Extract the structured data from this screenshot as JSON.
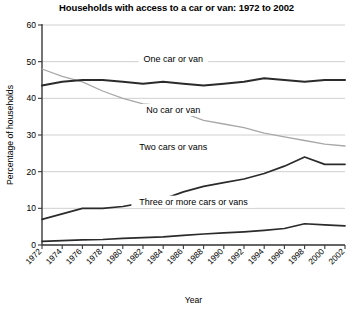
{
  "chart_data": {
    "type": "line",
    "title": "Households with access to a car or van: 1972 to 2002",
    "xlabel": "Year",
    "ylabel": "Percentage of households",
    "grid": true,
    "legend_position": "inline-labels",
    "xlim": [
      1972,
      2002
    ],
    "ylim": [
      0,
      60
    ],
    "yticks": [
      0,
      10,
      20,
      30,
      40,
      50,
      60
    ],
    "categories": [
      1972,
      1974,
      1976,
      1978,
      1980,
      1982,
      1984,
      1986,
      1988,
      1990,
      1992,
      1994,
      1996,
      1998,
      2000,
      2002
    ],
    "xtick_labels": [
      "1972",
      "1974",
      "1976",
      "1978",
      "1980",
      "1982",
      "1984",
      "1986",
      "1988",
      "1990",
      "1992",
      "1994",
      "1996",
      "1998",
      "2000",
      "2002"
    ],
    "series": [
      {
        "name": "No car or van",
        "color": "#a8a8a8",
        "width": 1.3,
        "label_x": 1985,
        "label_y": 36,
        "values": [
          48,
          46,
          44.5,
          42,
          40,
          38.5,
          38,
          36,
          34,
          33,
          32,
          30.5,
          29.5,
          28.5,
          27.5,
          27
        ]
      },
      {
        "name": "One car or van",
        "color": "#2b2b2b",
        "width": 2.0,
        "label_x": 1985,
        "label_y": 50,
        "values": [
          43.5,
          44.5,
          45,
          45,
          44.5,
          44,
          44.5,
          44,
          43.5,
          44,
          44.5,
          45.5,
          45,
          44.5,
          45,
          45
        ]
      },
      {
        "name": "Two cars or vans",
        "color": "#2b2b2b",
        "width": 1.7,
        "label_x": 1985,
        "label_y": 26,
        "values": [
          7,
          8.5,
          10,
          10,
          10.5,
          11.5,
          12.5,
          14.5,
          16,
          17,
          18,
          19.5,
          21.5,
          24,
          22,
          22
        ]
      },
      {
        "name": "Three or more cars or vans",
        "color": "#2b2b2b",
        "width": 1.7,
        "label_x": 1987,
        "label_y": 11,
        "values": [
          1,
          1.2,
          1.4,
          1.5,
          1.8,
          2,
          2.2,
          2.6,
          3,
          3.3,
          3.6,
          4,
          4.5,
          5.8,
          5.5,
          5.2
        ]
      }
    ]
  }
}
